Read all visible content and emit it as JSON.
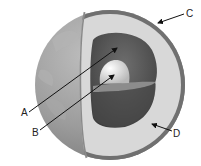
{
  "diagram": {
    "labels": [
      {
        "id": "A",
        "text": "A",
        "x": 21,
        "y": 108,
        "points_to": "outer-core"
      },
      {
        "id": "B",
        "text": "B",
        "x": 32,
        "y": 128,
        "points_to": "inner-core"
      },
      {
        "id": "C",
        "text": "C",
        "x": 186,
        "y": 9,
        "points_to": "crust"
      },
      {
        "id": "D",
        "text": "D",
        "x": 173,
        "y": 129,
        "points_to": "mantle"
      }
    ],
    "colors": {
      "globe": "#9a9a9a",
      "crust": "#6e6e6e",
      "mantle": "#d6d6d6",
      "outer_core": "#5a5a5a",
      "inner_core": "#e4e4e4",
      "arrow": "#111111"
    }
  }
}
